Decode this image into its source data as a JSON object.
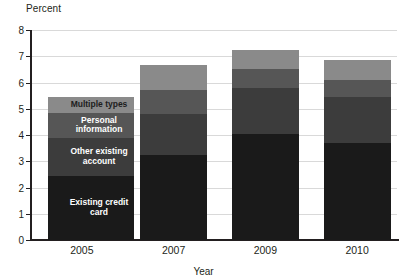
{
  "chart_data": {
    "type": "bar",
    "title": "",
    "subtitle": "",
    "xlabel": "Year",
    "ylabel": "Percent",
    "categories": [
      "2005",
      "2007",
      "2009",
      "2010"
    ],
    "ylim": [
      0,
      8
    ],
    "ytick_labels": [
      "0",
      "1",
      "2",
      "3",
      "4",
      "5",
      "6",
      "7",
      "8"
    ],
    "ytick_values": [
      0,
      1,
      2,
      3,
      4,
      5,
      6,
      7,
      8
    ],
    "grid": true,
    "stacked": true,
    "legend_position": "inside-left-overlay",
    "series": [
      {
        "name": "Existing credit card",
        "color": "#1a1a1a",
        "values": [
          2.45,
          3.25,
          4.05,
          3.7
        ]
      },
      {
        "name": "Other existing account",
        "color": "#3c3c3c",
        "values": [
          1.45,
          1.55,
          1.75,
          1.75
        ]
      },
      {
        "name": "Personal information",
        "color": "#565656",
        "values": [
          0.95,
          0.9,
          0.7,
          0.65
        ]
      },
      {
        "name": "Multiple types",
        "color": "#8a8a8a",
        "values": [
          0.6,
          0.95,
          0.75,
          0.75
        ]
      }
    ],
    "totals": [
      5.45,
      6.65,
      7.25,
      6.85
    ]
  },
  "legend": {
    "items": [
      {
        "label": "Multiple types",
        "color": "#8a8a8a"
      },
      {
        "label": "Personal information",
        "color": "#565656"
      },
      {
        "label": "Other existing account",
        "color": "#3c3c3c"
      },
      {
        "label": "Existing credit card",
        "color": "#1a1a1a"
      }
    ]
  }
}
